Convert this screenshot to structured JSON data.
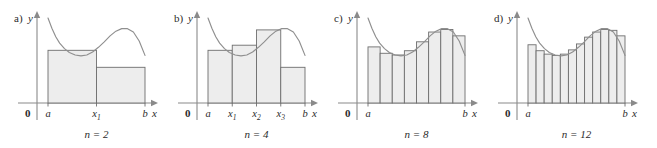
{
  "figure": {
    "background": "#ffffff",
    "bar_fill": "#ededed",
    "bar_stroke": "#6e6e6e",
    "curve_color": "#8f8f8f",
    "axis_color": "#8a8a8a"
  },
  "panels": [
    {
      "id": "a",
      "label": "a)",
      "caption": "n = 2",
      "n": 2,
      "y_axis_label": "y",
      "x_axis_label": "x",
      "origin_label": "0",
      "tick_labels": [
        "a",
        "x",
        "b"
      ],
      "tick_subscripts": [
        "",
        "1",
        ""
      ],
      "tick_x_values": [
        0,
        0.5,
        1
      ],
      "bar_heights": [
        0.62,
        0.42
      ]
    },
    {
      "id": "b",
      "label": "b)",
      "caption": "n = 4",
      "n": 4,
      "y_axis_label": "y",
      "x_axis_label": "x",
      "origin_label": "0",
      "tick_labels": [
        "a",
        "x",
        "x",
        "x",
        "b"
      ],
      "tick_subscripts": [
        "",
        "1",
        "2",
        "3",
        ""
      ],
      "tick_x_values": [
        0,
        0.25,
        0.5,
        0.75,
        1
      ],
      "bar_heights": [
        0.62,
        0.68,
        0.86,
        0.42
      ]
    },
    {
      "id": "c",
      "label": "c)",
      "caption": "n = 8",
      "n": 8,
      "y_axis_label": "y",
      "x_axis_label": "x",
      "origin_label": "0",
      "tick_labels": [
        "a",
        "b"
      ],
      "tick_subscripts": [
        "",
        ""
      ],
      "tick_x_values": [
        0,
        1
      ],
      "bar_heights": [
        0.66,
        0.585,
        0.565,
        0.615,
        0.72,
        0.835,
        0.865,
        0.79
      ]
    },
    {
      "id": "d",
      "label": "d)",
      "caption": "n = 12",
      "n": 12,
      "y_axis_label": "y",
      "x_axis_label": "x",
      "origin_label": "0",
      "tick_labels": [
        "a",
        "b"
      ],
      "tick_subscripts": [
        "",
        ""
      ],
      "tick_x_values": [
        0,
        1
      ],
      "bar_heights": [
        0.685,
        0.615,
        0.575,
        0.56,
        0.575,
        0.625,
        0.695,
        0.775,
        0.835,
        0.865,
        0.855,
        0.79
      ]
    }
  ],
  "chart_data": {
    "type": "area",
    "xlabel": "x",
    "ylabel": "y",
    "x_domain": [
      "a",
      "b"
    ],
    "subinterval_counts": [
      2,
      4,
      8,
      12
    ],
    "curve_description": "Function decreasing steeply from a high value at x=a to a local minimum near the left-center, rising to a local maximum near three-quarters of [a, b], then decreasing to b.",
    "curve_points_normalized": {
      "x": [
        0.0,
        0.04,
        0.08,
        0.12,
        0.17,
        0.22,
        0.28,
        0.34,
        0.4,
        0.46,
        0.52,
        0.58,
        0.64,
        0.7,
        0.76,
        0.82,
        0.88,
        0.94,
        1.0
      ],
      "y": [
        1.0,
        0.88,
        0.78,
        0.705,
        0.64,
        0.595,
        0.565,
        0.555,
        0.565,
        0.6,
        0.655,
        0.72,
        0.79,
        0.845,
        0.875,
        0.875,
        0.835,
        0.73,
        0.56
      ]
    },
    "series": [
      {
        "name": "n = 2",
        "rule": "left endpoint",
        "bar_heights": [
          0.62,
          0.42
        ]
      },
      {
        "name": "n = 4",
        "rule": "left endpoint",
        "bar_heights": [
          0.62,
          0.68,
          0.86,
          0.42
        ]
      },
      {
        "name": "n = 8",
        "rule": "left endpoint",
        "bar_heights": [
          0.66,
          0.585,
          0.565,
          0.615,
          0.72,
          0.835,
          0.865,
          0.79
        ]
      },
      {
        "name": "n = 12",
        "rule": "left endpoint",
        "bar_heights": [
          0.685,
          0.615,
          0.575,
          0.56,
          0.575,
          0.625,
          0.695,
          0.775,
          0.835,
          0.865,
          0.855,
          0.79
        ]
      }
    ],
    "legend": [],
    "grid": false
  }
}
